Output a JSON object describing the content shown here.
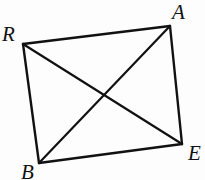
{
  "figure": {
    "kind": "geometry-diagram",
    "background_color": "#fdfdfd",
    "stroke_color": "#111111",
    "stroke_width": 2.4,
    "canvas": {
      "width": 205,
      "height": 180
    },
    "vertices": [
      {
        "id": "A",
        "label": "A",
        "x": 170,
        "y": 26,
        "label_x": 172,
        "label_y": 2
      },
      {
        "id": "R",
        "label": "R",
        "x": 23,
        "y": 44,
        "label_x": 2,
        "label_y": 24
      },
      {
        "id": "B",
        "label": "B",
        "x": 39,
        "y": 163,
        "label_x": 21,
        "label_y": 162
      },
      {
        "id": "E",
        "label": "E",
        "x": 182,
        "y": 144,
        "label_x": 188,
        "label_y": 143
      }
    ],
    "edges": [
      {
        "id": "RA",
        "from": "R",
        "to": "A"
      },
      {
        "id": "AE",
        "from": "A",
        "to": "E"
      },
      {
        "id": "EB",
        "from": "E",
        "to": "B"
      },
      {
        "id": "BR",
        "from": "B",
        "to": "R"
      }
    ],
    "diagonals": [
      {
        "id": "RE",
        "from": "R",
        "to": "E"
      },
      {
        "id": "AB",
        "from": "A",
        "to": "B"
      }
    ],
    "intersection": {
      "id": "P",
      "label": "",
      "x": 104,
      "y": 95
    }
  }
}
